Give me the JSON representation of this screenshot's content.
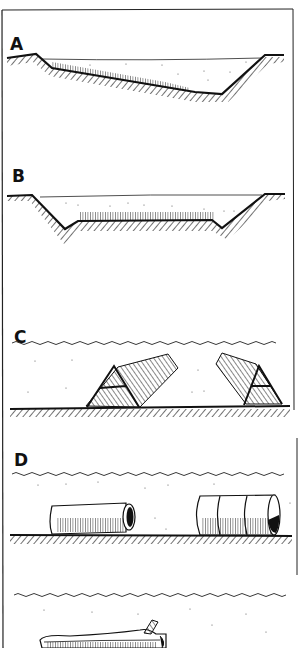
{
  "figure": {
    "ink_color": "#111111",
    "paper_color": "#ffffff",
    "panels": [
      {
        "id": "A",
        "label": "A",
        "description": "Sloped pond cross-section with vegetation along shallow bank"
      },
      {
        "id": "B",
        "label": "B",
        "description": "Trapezoidal pond cross-section with vegetated flat bottom"
      },
      {
        "id": "C",
        "label": "C",
        "description": "Two A-frame brush shelters on bottom under water surface"
      },
      {
        "id": "D",
        "label": "D",
        "description": "Two drum/pipe shelters lying on bottom under water surface"
      },
      {
        "id": "E",
        "label": "",
        "description": "Hollow log shelter under water surface (cropped)"
      }
    ]
  }
}
